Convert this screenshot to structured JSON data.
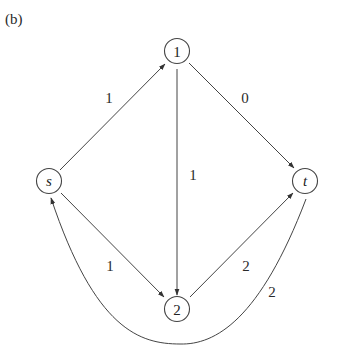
{
  "panel_label": "(b)",
  "nodes": [
    {
      "id": "1",
      "label": "1",
      "x": 177,
      "y": 51,
      "italic": false
    },
    {
      "id": "s",
      "label": "s",
      "x": 49,
      "y": 181,
      "italic": true
    },
    {
      "id": "t",
      "label": "t",
      "x": 305,
      "y": 181,
      "italic": true
    },
    {
      "id": "2",
      "label": "2",
      "x": 177,
      "y": 309,
      "italic": false
    }
  ],
  "edges": [
    {
      "from": "s",
      "to": "1",
      "weight": "1"
    },
    {
      "from": "1",
      "to": "t",
      "weight": "0"
    },
    {
      "from": "1",
      "to": "2",
      "weight": "1"
    },
    {
      "from": "s",
      "to": "2",
      "weight": "1"
    },
    {
      "from": "2",
      "to": "t",
      "weight": "2"
    },
    {
      "from": "t",
      "to": "s",
      "weight": "2",
      "curved": true
    }
  ],
  "weight_labels": {
    "s_1": "1",
    "1_t": "0",
    "1_2": "1",
    "s_2": "1",
    "2_t": "2",
    "t_s": "2"
  }
}
